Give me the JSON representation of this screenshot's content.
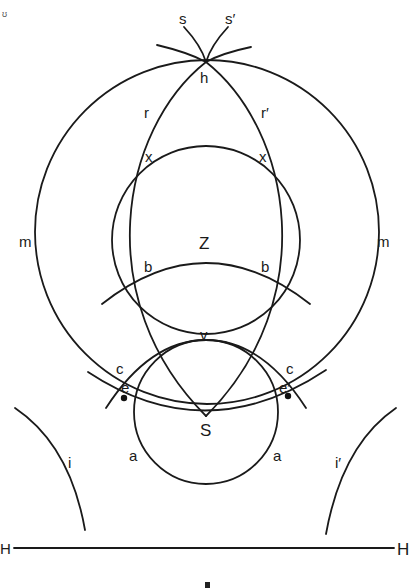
{
  "diagram": {
    "type": "geometric construction",
    "stroke_color": "#1a1a1a",
    "background": "#ffffff",
    "corner_mark": "ʊ",
    "points": {
      "h": "h",
      "v": "v",
      "S": "S",
      "Z": "Z",
      "e": "e",
      "e_prime": "e′"
    },
    "curves": {
      "s": "s",
      "s_prime": "s′",
      "r": "r",
      "r_prime": "r′",
      "x_left": "x",
      "x_right": "x",
      "m_left": "m",
      "m_right": "m",
      "b_left": "b",
      "b_right": "b",
      "c_left": "c",
      "c_right": "c",
      "a_left": "a",
      "a_right": "a",
      "i": "i",
      "i_prime": "i′"
    },
    "horizon": {
      "left": "H",
      "right": "H"
    }
  }
}
